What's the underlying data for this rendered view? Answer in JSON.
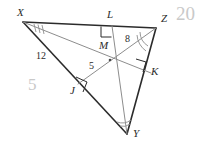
{
  "diagram": {
    "kind": "geometry-triangle-altitudes",
    "colors": {
      "triangle_stroke": "#2b2b2b",
      "cevian_stroke": "#8d8d8d",
      "label_text": "#2b2b2b",
      "scribble": "#c9c9c9",
      "background": "#ffffff"
    },
    "vertices": [
      {
        "id": "X",
        "label": "X",
        "x": 23,
        "y": 22,
        "label_x": 17,
        "label_y": 7
      },
      {
        "id": "Z",
        "label": "Z",
        "x": 156,
        "y": 28,
        "label_x": 161,
        "label_y": 13
      },
      {
        "id": "Y",
        "label": "Y",
        "x": 127,
        "y": 134,
        "label_x": 133,
        "label_y": 128
      }
    ],
    "points": [
      {
        "id": "L",
        "label": "L",
        "x": 112,
        "y": 26,
        "label_x": 107,
        "label_y": 9
      },
      {
        "id": "M",
        "label": "M",
        "x": 110,
        "y": 60,
        "label_x": 99,
        "label_y": 40
      },
      {
        "id": "J",
        "label": "J",
        "x": 80,
        "y": 85,
        "label_x": 70,
        "label_y": 85
      },
      {
        "id": "K",
        "label": "K",
        "x": 148,
        "y": 70,
        "label_x": 151,
        "label_y": 66
      }
    ],
    "measures": [
      {
        "id": "XJ",
        "value": "12",
        "x": 36,
        "y": 51
      },
      {
        "id": "JM",
        "value": "5",
        "x": 89,
        "y": 61
      },
      {
        "id": "MK",
        "value": "8",
        "x": 125,
        "y": 34
      }
    ],
    "annotations": [
      {
        "id": "top-right-scribble",
        "value": "20",
        "x": 176,
        "y": 4,
        "size": 19
      },
      {
        "id": "left-scribble",
        "value": "5",
        "x": 28,
        "y": 76,
        "size": 17
      }
    ],
    "angle_marks": [
      {
        "id": "angle-X-ticks",
        "at": "X",
        "count": 3
      },
      {
        "id": "angle-Z-arcs",
        "at": "Z",
        "count": 2
      },
      {
        "id": "angle-Y-arcs",
        "at": "Y",
        "count": 2
      }
    ],
    "right_angles": [
      {
        "id": "right-angle-at-L",
        "at": "L"
      },
      {
        "id": "right-angle-at-J",
        "at": "J"
      },
      {
        "id": "right-angle-at-K",
        "at": "K"
      }
    ]
  }
}
